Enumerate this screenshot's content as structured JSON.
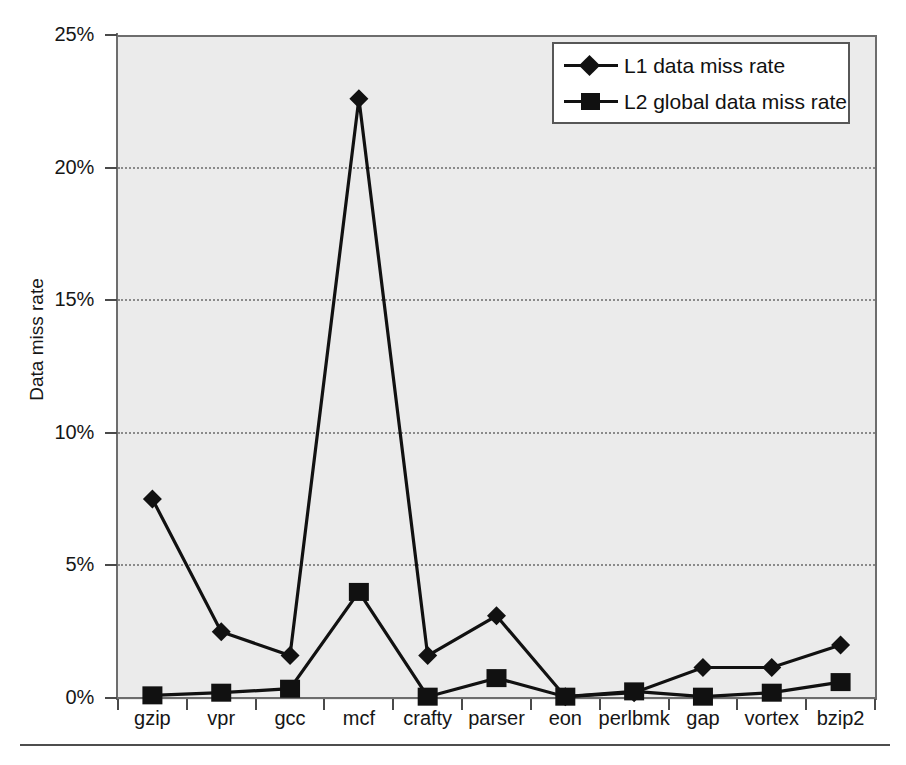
{
  "chart_data": {
    "type": "line",
    "title": "",
    "xlabel": "",
    "ylabel": "Data miss rate",
    "categories": [
      "gzip",
      "vpr",
      "gcc",
      "mcf",
      "crafty",
      "parser",
      "eon",
      "perlbmk",
      "gap",
      "vortex",
      "bzip2"
    ],
    "series": [
      {
        "name": "L1 data miss rate",
        "marker": "diamond",
        "color": "#111111",
        "values": [
          7.5,
          2.5,
          1.6,
          22.6,
          1.6,
          3.1,
          0.05,
          0.2,
          1.15,
          1.15,
          2.0
        ]
      },
      {
        "name": "L2 global data miss rate",
        "marker": "square",
        "color": "#111111",
        "values": [
          0.1,
          0.2,
          0.35,
          4.0,
          0.05,
          0.75,
          0.05,
          0.25,
          0.05,
          0.2,
          0.6
        ]
      }
    ],
    "ylim": [
      0,
      25
    ],
    "yticks": [
      0,
      5,
      10,
      15,
      20,
      25
    ],
    "ytick_labels": [
      "0%",
      "5%",
      "10%",
      "15%",
      "20%",
      "25%"
    ],
    "grid": true,
    "grid_style": "dotted-horizontal",
    "legend_position": "top-right",
    "plot_background": "#ebebeb",
    "figure_background": "#ffffff"
  },
  "legend": {
    "entries": [
      {
        "label": "L1 data miss rate",
        "marker": "diamond"
      },
      {
        "label": "L2 global data miss rate",
        "marker": "square"
      }
    ]
  }
}
